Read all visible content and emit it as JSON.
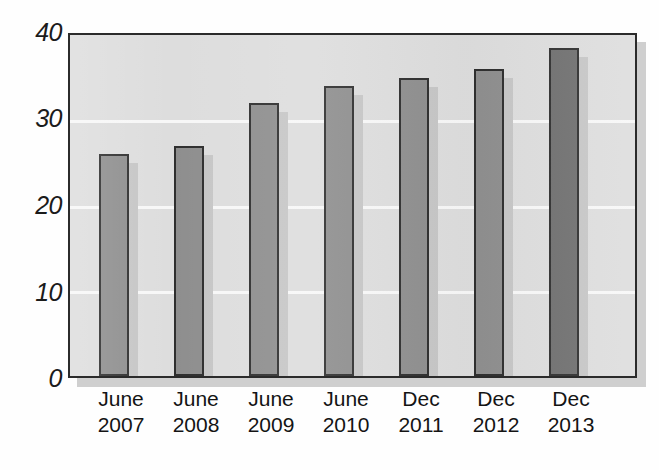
{
  "chart_data": {
    "type": "bar",
    "title": "",
    "subtitle": "",
    "xlabel": "",
    "ylabel": "",
    "categories": [
      "June 2007",
      "June 2008",
      "June 2009",
      "June 2010",
      "Dec 2011",
      "Dec 2012",
      "Dec 2013"
    ],
    "category_lines": [
      {
        "line1": "June",
        "line2": "2007"
      },
      {
        "line1": "June",
        "line2": "2008"
      },
      {
        "line1": "June",
        "line2": "2009"
      },
      {
        "line1": "June",
        "line2": "2010"
      },
      {
        "line1": "Dec",
        "line2": "2011"
      },
      {
        "line1": "Dec",
        "line2": "2012"
      },
      {
        "line1": "Dec",
        "line2": "2013"
      }
    ],
    "values": [
      26,
      27,
      32,
      34,
      35,
      36,
      38.5
    ],
    "ylim": [
      0,
      40
    ],
    "yticks": [
      0,
      10,
      20,
      30,
      40
    ],
    "ytick_labels": [
      "0",
      "10",
      "20",
      "30",
      "40"
    ],
    "grid": true,
    "gridlines_at": [
      10,
      20,
      30
    ],
    "legend": "none",
    "highlight_index": 6,
    "colors": {
      "bar": "#8e8e8e",
      "bar_highlight": "#6f6f6f",
      "bar_outline": "#2e2e2e",
      "bar_shadow": "#c6c6c6",
      "plot_background": "#dddddd",
      "plot_outline": "#2b2b2b",
      "plot_shadow": "#cfcfcf",
      "gridline": "#f7f7f7",
      "text": "#141414",
      "page_background": "#ffffff"
    }
  }
}
